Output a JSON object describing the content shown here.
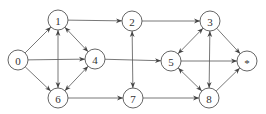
{
  "diagram": {
    "type": "directed-graph",
    "colors": {
      "stroke": "#555555",
      "background": "#ffffff",
      "text": "#333333"
    },
    "node_radius": 10,
    "nodes": [
      {
        "id": "0",
        "label": "0",
        "x": 18,
        "y": 60
      },
      {
        "id": "1",
        "label": "1",
        "x": 58,
        "y": 20
      },
      {
        "id": "2",
        "label": "2",
        "x": 132,
        "y": 21
      },
      {
        "id": "3",
        "label": "3",
        "x": 210,
        "y": 21
      },
      {
        "id": "4",
        "label": "4",
        "x": 95,
        "y": 59
      },
      {
        "id": "5",
        "label": "5",
        "x": 171,
        "y": 61
      },
      {
        "id": "6",
        "label": "6",
        "x": 58,
        "y": 98
      },
      {
        "id": "7",
        "label": "7",
        "x": 133,
        "y": 98
      },
      {
        "id": "8",
        "label": "8",
        "x": 209,
        "y": 98
      },
      {
        "id": "*",
        "label": "*",
        "x": 247,
        "y": 61
      }
    ],
    "edges": [
      {
        "from": "0",
        "to": "1",
        "bidirectional": false
      },
      {
        "from": "0",
        "to": "4",
        "bidirectional": false
      },
      {
        "from": "0",
        "to": "6",
        "bidirectional": false
      },
      {
        "from": "1",
        "to": "2",
        "bidirectional": false
      },
      {
        "from": "1",
        "to": "4",
        "bidirectional": true
      },
      {
        "from": "1",
        "to": "6",
        "bidirectional": true
      },
      {
        "from": "4",
        "to": "6",
        "bidirectional": true
      },
      {
        "from": "4",
        "to": "5",
        "bidirectional": false
      },
      {
        "from": "6",
        "to": "7",
        "bidirectional": false
      },
      {
        "from": "2",
        "to": "3",
        "bidirectional": false
      },
      {
        "from": "2",
        "to": "7",
        "bidirectional": true
      },
      {
        "from": "7",
        "to": "8",
        "bidirectional": false
      },
      {
        "from": "3",
        "to": "5",
        "bidirectional": true
      },
      {
        "from": "3",
        "to": "8",
        "bidirectional": true
      },
      {
        "from": "5",
        "to": "8",
        "bidirectional": true
      },
      {
        "from": "3",
        "to": "*",
        "bidirectional": false
      },
      {
        "from": "5",
        "to": "*",
        "bidirectional": false
      },
      {
        "from": "8",
        "to": "*",
        "bidirectional": false
      }
    ]
  }
}
